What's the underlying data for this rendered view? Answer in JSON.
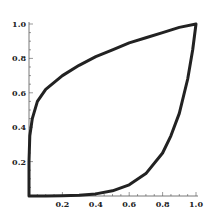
{
  "chart_data": {
    "type": "line",
    "title": "",
    "xlabel": "",
    "ylabel": "",
    "xlim": [
      0,
      1.0
    ],
    "ylim": [
      0,
      1.0
    ],
    "grid": false,
    "legend": null,
    "x_ticks": [
      "0.2",
      "0.4",
      "0.6",
      "0.8",
      "1.0"
    ],
    "y_ticks": [
      "0.2",
      "0.4",
      "0.6",
      "0.8",
      "1.0"
    ],
    "series": [
      {
        "name": "closed curve",
        "color": "#222222",
        "x": [
          0,
          0.0,
          0.005,
          0.02,
          0.05,
          0.1,
          0.2,
          0.3,
          0.4,
          0.5,
          0.6,
          0.7,
          0.8,
          0.9,
          1.0,
          0.98,
          0.95,
          0.9,
          0.85,
          0.8,
          0.7,
          0.6,
          0.5,
          0.4,
          0.3,
          0.2,
          0.1,
          0.0
        ],
        "y": [
          0,
          0.2,
          0.35,
          0.45,
          0.55,
          0.62,
          0.7,
          0.76,
          0.81,
          0.85,
          0.89,
          0.92,
          0.95,
          0.98,
          1.0,
          0.85,
          0.68,
          0.48,
          0.35,
          0.25,
          0.13,
          0.065,
          0.03,
          0.012,
          0.004,
          0.001,
          0.0,
          0.0
        ]
      }
    ]
  }
}
